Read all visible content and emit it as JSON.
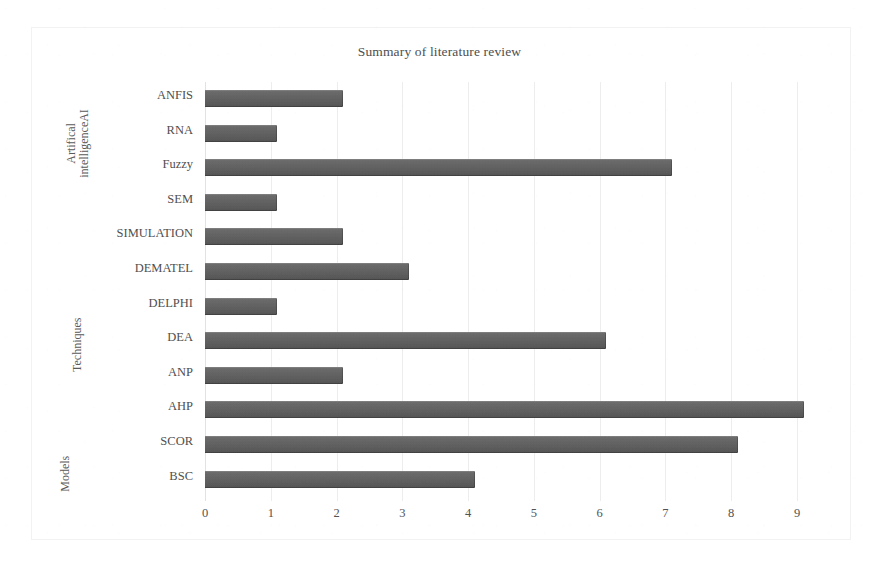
{
  "chart_data": {
    "type": "bar",
    "orientation": "horizontal",
    "title": "Summary of literature review",
    "xlabel": "",
    "ylabel": "",
    "xlim": [
      0,
      9.6
    ],
    "xticks": [
      "0",
      "1",
      "2",
      "3",
      "4",
      "5",
      "6",
      "7",
      "8",
      "9"
    ],
    "xtick_values": [
      0,
      1,
      2,
      3,
      4,
      5,
      6,
      7,
      8,
      9
    ],
    "grid": "vertical",
    "legend": "none",
    "bar_color": "#5d5d5d",
    "gridline_color": "#ededed",
    "categories": [
      "ANFIS",
      "RNA",
      "Fuzzy",
      "SEM",
      "SIMULATION",
      "DEMATEL",
      "DELPHI",
      "DEA",
      "ANP",
      "AHP",
      "SCOR",
      "BSC"
    ],
    "values": [
      2.1,
      1.1,
      7.1,
      1.1,
      2.1,
      3.1,
      1.1,
      6.1,
      2.1,
      9.1,
      8.1,
      4.1
    ],
    "groups": [
      {
        "label": "Artifical\nintelligenceAI",
        "categories": [
          "ANFIS",
          "RNA",
          "Fuzzy"
        ]
      },
      {
        "label": "Techniques",
        "categories": [
          "SEM",
          "SIMULATION",
          "DEMATEL",
          "DELPHI",
          "DEA",
          "ANP"
        ]
      },
      {
        "label": "Models",
        "categories": [
          "AHP",
          "SCOR",
          "BSC"
        ]
      }
    ]
  },
  "chart": {
    "title": "Summary of literature review",
    "groups": {
      "ai": "Artifical\nintelligenceAI",
      "techniques": "Techniques",
      "models": "Models"
    },
    "bars": [
      {
        "label": "ANFIS",
        "value": 2.1
      },
      {
        "label": "RNA",
        "value": 1.1
      },
      {
        "label": "Fuzzy",
        "value": 7.1
      },
      {
        "label": "SEM",
        "value": 1.1
      },
      {
        "label": "SIMULATION",
        "value": 2.1
      },
      {
        "label": "DEMATEL",
        "value": 3.1
      },
      {
        "label": "DELPHI",
        "value": 1.1
      },
      {
        "label": "DEA",
        "value": 6.1
      },
      {
        "label": "ANP",
        "value": 2.1
      },
      {
        "label": "AHP",
        "value": 9.1
      },
      {
        "label": "SCOR",
        "value": 8.1
      },
      {
        "label": "BSC",
        "value": 4.1
      }
    ],
    "xticks": [
      "0",
      "1",
      "2",
      "3",
      "4",
      "5",
      "6",
      "7",
      "8",
      "9"
    ]
  }
}
